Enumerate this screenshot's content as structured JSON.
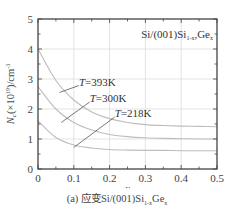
{
  "chart_data": {
    "type": "line",
    "title": "",
    "annotation": "Si/(001)Si1-xGex",
    "annotation_main": "Si/(001)Si",
    "annotation_sub1": "1-x",
    "annotation_mid": "Ge",
    "annotation_sub2": "x",
    "xlabel": "x",
    "ylabel": "Nc(×10^19)/cm^-3",
    "xlim": [
      0,
      0.5
    ],
    "ylim": [
      0,
      5
    ],
    "xticks": [
      "0",
      "0.1",
      "0.2",
      "0.3",
      "0.4",
      "0.5"
    ],
    "yticks": [
      "0",
      "1",
      "2",
      "3",
      "4",
      "5"
    ],
    "grid": true,
    "x": [
      0,
      0.05,
      0.1,
      0.15,
      0.2,
      0.25,
      0.3,
      0.35,
      0.4,
      0.45,
      0.5
    ],
    "series": [
      {
        "name": "T=393K",
        "values": [
          4.0,
          2.95,
          2.3,
          1.9,
          1.68,
          1.55,
          1.48,
          1.45,
          1.43,
          1.42,
          1.41
        ],
        "label_pos": [
          0.12,
          2.85
        ],
        "leader_from": [
          0.06,
          2.55
        ]
      },
      {
        "name": "T=300K",
        "values": [
          2.75,
          2.0,
          1.55,
          1.3,
          1.15,
          1.08,
          1.04,
          1.02,
          1.01,
          1.0,
          1.0
        ],
        "label_pos": [
          0.15,
          2.3
        ],
        "leader_from": [
          0.065,
          1.55
        ]
      },
      {
        "name": "T=218K",
        "values": [
          1.6,
          1.05,
          0.8,
          0.7,
          0.65,
          0.63,
          0.62,
          0.62,
          0.61,
          0.61,
          0.61
        ],
        "label_pos": [
          0.22,
          1.8
        ],
        "leader_from": [
          0.1,
          0.72
        ]
      }
    ]
  },
  "caption": {
    "prefix": "(a) 应变Si/(001)Si",
    "sub1": "1-x",
    "mid": "Ge",
    "sub2": "x"
  }
}
